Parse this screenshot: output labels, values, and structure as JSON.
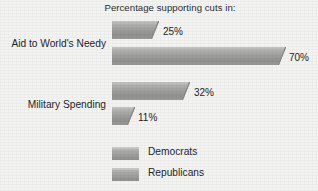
{
  "chart_data": {
    "type": "bar",
    "orientation": "horizontal",
    "title": "Percentage supporting cuts in:",
    "xlabel": "",
    "ylabel": "",
    "categories": [
      "Aid to World's Needy",
      "Military Spending"
    ],
    "series": [
      {
        "name": "Democrats",
        "values": [
          25,
          32
        ],
        "labels": [
          "25%",
          "32%"
        ],
        "color": "#a5a5a4"
      },
      {
        "name": "Republicans",
        "values": [
          70,
          11
        ],
        "labels": [
          "70%",
          "11%"
        ],
        "color": "#a5a5a4"
      }
    ],
    "xlim": [
      0,
      100
    ],
    "grid": false,
    "legend_position": "bottom-center",
    "value_labels_shown": true
  },
  "chart": {
    "title": "Percentage supporting cuts in:",
    "background_color": "#f3f3f2",
    "text_color": "#26262a",
    "groups": [
      {
        "label": "Aid to World's Needy",
        "bars": [
          {
            "series": "Democrats",
            "value": 25,
            "label": "25%"
          },
          {
            "series": "Republicans",
            "value": 70,
            "label": "70%"
          }
        ]
      },
      {
        "label": "Military Spending",
        "bars": [
          {
            "series": "Democrats",
            "value": 32,
            "label": "32%"
          },
          {
            "series": "Republicans",
            "value": 11,
            "label": "11%"
          }
        ]
      }
    ],
    "legend": {
      "items": [
        {
          "label": "Democrats",
          "swatch_color": "#a5a5a4"
        },
        {
          "label": "Republicans",
          "swatch_color": "#a5a5a4"
        }
      ]
    }
  }
}
